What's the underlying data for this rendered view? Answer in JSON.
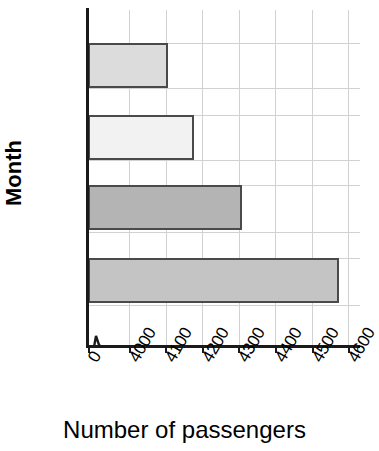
{
  "chart_data": {
    "type": "bar",
    "orientation": "horizontal",
    "title": "",
    "categories": [
      "Dec",
      "Jan",
      "Feb",
      "Mar"
    ],
    "values": [
      4105,
      4177,
      4310,
      4575
    ],
    "xlabel": "Number of passengers",
    "ylabel": "Month",
    "xlim": [
      4000,
      4600
    ],
    "xticks": [
      "0",
      "4000",
      "4100",
      "4200",
      "4300",
      "4400",
      "4500",
      "4600"
    ],
    "xtick_values": [
      0,
      4000,
      4100,
      4200,
      4300,
      4400,
      4500,
      4600
    ],
    "axis_break": true,
    "grid": true,
    "legend": "none",
    "bar_colors": [
      "#dcdcdc",
      "#f2f2f2",
      "#b4b4b4",
      "#c4c4c4"
    ],
    "bar_edge_color": "#4a4a4a",
    "grid_color": "#d2d2d2",
    "axis_color": "#1a1a1a",
    "series": [
      {
        "name": "Number of passengers",
        "points": [
          {
            "category": "Dec",
            "value": 4105
          },
          {
            "category": "Jan",
            "value": 4177
          },
          {
            "category": "Feb",
            "value": 4310
          },
          {
            "category": "Mar",
            "value": 4575
          }
        ]
      }
    ]
  },
  "axes": {
    "x_title": "Number of passengers",
    "y_title": "Month",
    "x_tick_labels": [
      "0",
      "4000",
      "4100",
      "4200",
      "4300",
      "4400",
      "4500",
      "4600"
    ],
    "y_tick_labels": [
      "Dec",
      "Jan",
      "Feb",
      "Mar"
    ]
  },
  "icons": {
    "axis_break": "axis-break-zigzag-icon"
  }
}
